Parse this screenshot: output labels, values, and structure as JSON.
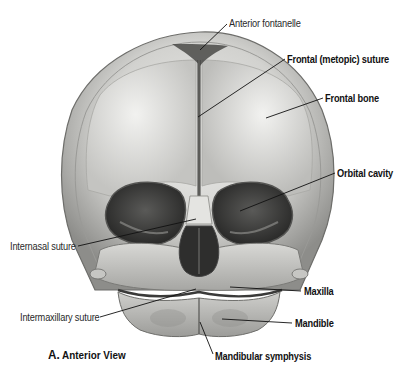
{
  "figure": {
    "caption": {
      "letter": "A.",
      "text": "Anterior View"
    },
    "colors": {
      "background": "#ffffff",
      "bone_light": "#e6e6e4",
      "bone_mid": "#b9b9b6",
      "bone_dark": "#6f6f6c",
      "cavity": "#3b3b3a",
      "label_text": "#111111",
      "leader_line": "#111111"
    },
    "labels": [
      {
        "id": "anterior-fontanelle",
        "text": "Anterior fontanelle",
        "weight": "regular",
        "side": "right"
      },
      {
        "id": "frontal-metopic-suture",
        "text": "Frontal (metopic) suture",
        "weight": "bold",
        "side": "right"
      },
      {
        "id": "frontal-bone",
        "text": "Frontal bone",
        "weight": "bold",
        "side": "right"
      },
      {
        "id": "orbital-cavity",
        "text": "Orbital cavity",
        "weight": "bold",
        "side": "right"
      },
      {
        "id": "internasal-suture",
        "text": "Internasal suture",
        "weight": "regular",
        "side": "left"
      },
      {
        "id": "maxilla",
        "text": "Maxilla",
        "weight": "bold",
        "side": "right"
      },
      {
        "id": "intermaxillary-suture",
        "text": "Intermaxillary suture",
        "weight": "regular",
        "side": "left"
      },
      {
        "id": "mandible",
        "text": "Mandible",
        "weight": "bold",
        "side": "right"
      },
      {
        "id": "mandibular-symphysis",
        "text": "Mandibular symphysis",
        "weight": "bold",
        "side": "bottom"
      }
    ]
  }
}
